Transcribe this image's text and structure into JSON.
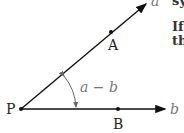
{
  "diagram": {
    "point_labels": {
      "P": "P",
      "A": "A",
      "B": "B"
    },
    "ray_labels": {
      "upper": "a",
      "lower": "b"
    },
    "angle_label": "a − b",
    "colors": {
      "line": "#111111",
      "angle_label": "#777777",
      "arc": "#666666"
    }
  },
  "side_text": [
    "sy",
    "If",
    "th"
  ]
}
